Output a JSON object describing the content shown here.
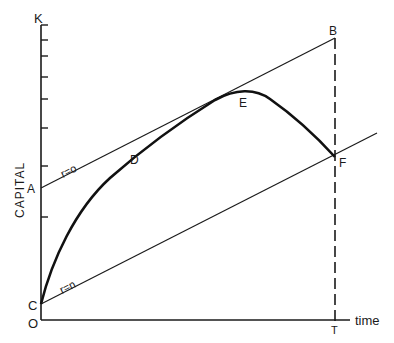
{
  "diagram": {
    "type": "economic-growth-diagram",
    "y_axis": {
      "label": "K",
      "title": "CAPITAL",
      "tick_count": 9
    },
    "x_axis": {
      "label": "time",
      "origin_label": "O",
      "end_label": "T"
    },
    "lines": [
      {
        "name": "r=0",
        "label": "r=o",
        "from": "A",
        "to": "B"
      },
      {
        "name": "r=n",
        "label": "r=n",
        "from": "C",
        "through": "F"
      }
    ],
    "curve": {
      "points": [
        "C",
        "D",
        "E",
        "F"
      ]
    },
    "points": {
      "A": "A",
      "B": "B",
      "C": "C",
      "D": "D",
      "E": "E",
      "F": "F",
      "O": "O",
      "T": "T",
      "K": "K"
    },
    "dashed_line": {
      "from": "B",
      "to": "T"
    },
    "colors": {
      "ink": "#1a1a1a",
      "background": "#ffffff"
    }
  }
}
